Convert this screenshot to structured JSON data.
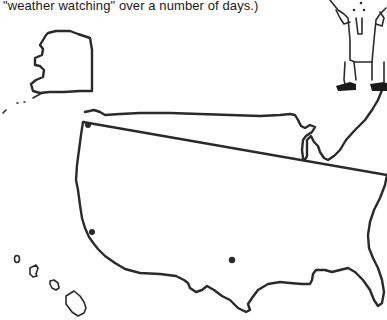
{
  "page": {
    "caption": "\"weather watching\" over a number of days.)"
  },
  "map": {
    "regions": [
      "Alaska",
      "Hawaii",
      "Contiguous United States"
    ],
    "markers": [
      {
        "name": "northwest-city",
        "x": 88,
        "y": 125
      },
      {
        "name": "california-city",
        "x": 92,
        "y": 232
      },
      {
        "name": "southwest-city",
        "x": 232,
        "y": 260
      }
    ],
    "line_color": "#2a2a2a"
  },
  "illustration": {
    "subject": "cartoon weather watcher figure (legs, coat, shoes)"
  }
}
